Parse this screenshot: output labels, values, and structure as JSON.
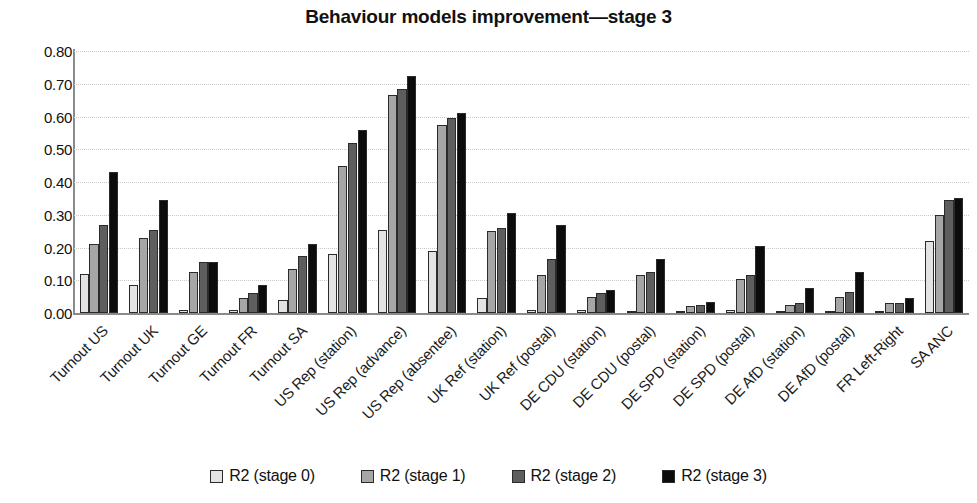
{
  "chart_data": {
    "type": "bar",
    "title": "Behaviour models improvement—stage 3",
    "xlabel": "",
    "ylabel": "",
    "ylim": [
      0.0,
      0.8
    ],
    "yticks": [
      "0.00",
      "0.10",
      "0.20",
      "0.30",
      "0.40",
      "0.50",
      "0.60",
      "0.70",
      "0.80"
    ],
    "grid": true,
    "legend_position": "bottom",
    "categories": [
      "Turnout US",
      "Turnout UK",
      "Turnout GE",
      "Turnout FR",
      "Turnout SA",
      "US Rep (station)",
      "US Rep (advance)",
      "US Rep (absentee)",
      "UK Ref (station)",
      "UK Ref (postal)",
      "DE CDU (station)",
      "DE CDU (postal)",
      "DE SPD (station)",
      "DE SPD (postal)",
      "DE AfD (station)",
      "DE AfD (postal)",
      "FR Left-Right",
      "SA ANC"
    ],
    "series": [
      {
        "name": "R2 (stage 0)",
        "color": "#e3e3e3",
        "values": [
          0.12,
          0.085,
          0.01,
          0.01,
          0.04,
          0.18,
          0.255,
          0.19,
          0.045,
          0.01,
          0.01,
          0.005,
          0.005,
          0.01,
          0.005,
          0.005,
          0.005,
          0.22
        ]
      },
      {
        "name": "R2 (stage 1)",
        "color": "#a6a6a6",
        "values": [
          0.21,
          0.23,
          0.125,
          0.045,
          0.135,
          0.45,
          0.665,
          0.575,
          0.25,
          0.115,
          0.05,
          0.115,
          0.02,
          0.105,
          0.025,
          0.05,
          0.03,
          0.3
        ]
      },
      {
        "name": "R2 (stage 2)",
        "color": "#5e5e5e",
        "values": [
          0.27,
          0.255,
          0.155,
          0.06,
          0.175,
          0.52,
          0.685,
          0.595,
          0.26,
          0.165,
          0.06,
          0.125,
          0.025,
          0.115,
          0.03,
          0.065,
          0.03,
          0.345
        ]
      },
      {
        "name": "R2 (stage 3)",
        "color": "#0c0c0c",
        "values": [
          0.43,
          0.345,
          0.155,
          0.085,
          0.21,
          0.56,
          0.725,
          0.61,
          0.305,
          0.27,
          0.07,
          0.165,
          0.035,
          0.205,
          0.075,
          0.125,
          0.045,
          0.35
        ]
      }
    ]
  },
  "legend": {
    "items": [
      {
        "label": "R2 (stage 0)",
        "swatch": "#e3e3e3"
      },
      {
        "label": "R2 (stage 1)",
        "swatch": "#a6a6a6"
      },
      {
        "label": "R2 (stage 2)",
        "swatch": "#5e5e5e"
      },
      {
        "label": "R2 (stage 3)",
        "swatch": "#0c0c0c"
      }
    ]
  }
}
